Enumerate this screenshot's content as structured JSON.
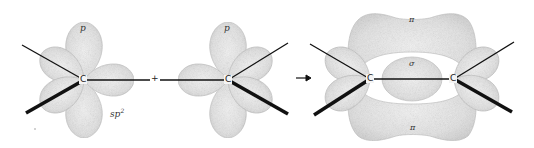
{
  "diagram": {
    "colors": {
      "lobe_fill": "#e6e6e6",
      "lobe_stroke": "#b5b5b5",
      "bond": "#111111",
      "background": "#ffffff"
    },
    "left_atom": {
      "symbol": "C",
      "p_label": "p",
      "hybrid_label": "sp",
      "hybrid_superscript": "2"
    },
    "plus": "+",
    "middle_atom": {
      "symbol": "C",
      "p_label": "p"
    },
    "arrow": "→",
    "product": {
      "left_symbol": "C",
      "right_symbol": "C",
      "pi_top_label": "π",
      "sigma_label": "σ",
      "pi_bottom_label": "π"
    }
  }
}
